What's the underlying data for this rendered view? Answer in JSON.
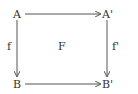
{
  "diagram": {
    "type": "commutative-square",
    "nodes": {
      "top_left": "A",
      "top_right": "A'",
      "bottom_left": "B",
      "bottom_right": "B'"
    },
    "edges": {
      "left": "f",
      "right": "f'",
      "center": "F"
    },
    "colors": {
      "stroke": "#555555",
      "text": "#333333"
    }
  }
}
